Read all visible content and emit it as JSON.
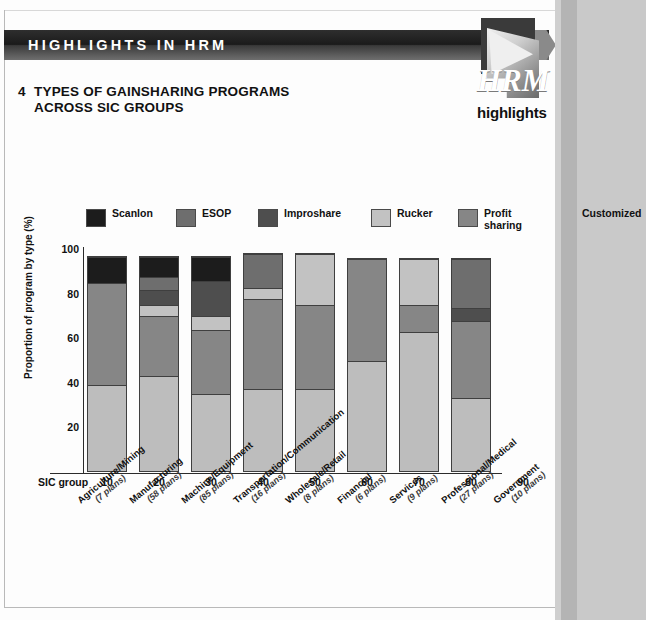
{
  "header": {
    "banner_title": "HIGHLIGHTS IN HRM",
    "logo_wordmark": "HRM",
    "logo_sub": "highlights"
  },
  "chart_title": {
    "number": "4",
    "line1": "TYPES OF GAINSHARING PROGRAMS",
    "line2": "ACROSS SIC GROUPS"
  },
  "axis": {
    "sic_group_label": "SIC group",
    "ylabel": "Proportion of program by type (%)",
    "yticks": [
      "100",
      "80",
      "60",
      "40",
      "20"
    ]
  },
  "colors": {
    "scanlon": "#1c1c1c",
    "esop": "#6e6e6e",
    "improshare": "#4e4e4e",
    "rucker": "#c2c2c2",
    "profit_sharing": "#868686",
    "customized": "#bdbdbd",
    "banner": "#1b1b1b",
    "page": "#fdfdfd"
  },
  "chart_data": {
    "type": "bar",
    "xlabel": "SIC group",
    "ylabel": "Proportion of program by type (%)",
    "ylim": [
      0,
      100
    ],
    "grid": false,
    "legend_position": "top",
    "stacked": true,
    "categories": [
      "10",
      "20",
      "30",
      "40",
      "50",
      "60",
      "70",
      "80",
      "90"
    ],
    "category_names": [
      "Agriculture/Mining",
      "Manufacturing",
      "Machine/Equipment",
      "Transportation/Communication",
      "Wholesale/Retail",
      "Financial",
      "Services",
      "Professional/Medical",
      "Government"
    ],
    "category_counts": [
      "(7 plans)",
      "(58 plans)",
      "(85 plans)",
      "(16 plans)",
      "(8 plans)",
      "(6 plans)",
      "(9 plans)",
      "(27 plans)",
      "(10 plans)"
    ],
    "series": [
      {
        "name": "Scanlon",
        "values": [
          12,
          9,
          11,
          0,
          0,
          0,
          0,
          0,
          0
        ]
      },
      {
        "name": "ESOP",
        "values": [
          0,
          6,
          0,
          15,
          0,
          0,
          0,
          22,
          0
        ]
      },
      {
        "name": "Improshare",
        "values": [
          0,
          7,
          16,
          0,
          0,
          0,
          0,
          6,
          0
        ]
      },
      {
        "name": "Rucker",
        "values": [
          0,
          5,
          6,
          5,
          23,
          0,
          21,
          0,
          0
        ]
      },
      {
        "name": "Profit sharing",
        "values": [
          46,
          27,
          29,
          41,
          38,
          46,
          12,
          35,
          0
        ]
      },
      {
        "name": "Customized",
        "values": [
          39,
          43,
          35,
          37,
          37,
          50,
          63,
          33,
          0
        ]
      }
    ],
    "legend": [
      {
        "label": "Scanlon",
        "color": "#1c1c1c"
      },
      {
        "label": "ESOP",
        "color": "#6e6e6e"
      },
      {
        "label": "Improshare",
        "color": "#4e4e4e"
      },
      {
        "label": "Rucker",
        "color": "#c2c2c2"
      },
      {
        "label": "Profit\nsharing",
        "color": "#868686"
      },
      {
        "label": "Customized",
        "color": "#bdbdbd"
      }
    ]
  }
}
